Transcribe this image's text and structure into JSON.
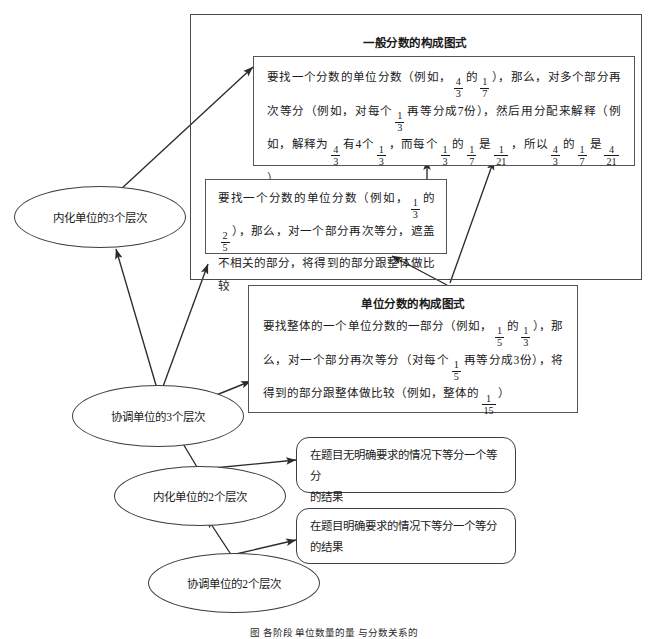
{
  "diagram": {
    "title_outer_panel": "一般分数的构成图式",
    "title_inner_panel": "单位分数的构成图式",
    "general_fraction_box": {
      "line1_a": "要找一个分数的单位分数（例如，",
      "f1": [
        "4",
        "3"
      ],
      "line1_b": "的",
      "f2": [
        "1",
        "7"
      ],
      "line1_c": "），那么，对多个部分再次等分",
      "line2_a": "（例如，对每个",
      "f3": [
        "1",
        "3"
      ],
      "line2_b": "再等分成7份），然后用分配来解释（例如，解释为",
      "f4": [
        "4",
        "3"
      ],
      "line2_c": "有",
      "line3_a": "4个",
      "f5": [
        "1",
        "3"
      ],
      "line3_b": "，而每个",
      "f6": [
        "1",
        "3"
      ],
      "line3_c": "的",
      "f7": [
        "1",
        "7"
      ],
      "line3_d": "是",
      "f8": [
        "1",
        "21"
      ],
      "line3_e": "，所以",
      "f9": [
        "4",
        "3"
      ],
      "line3_f": "的",
      "f10": [
        "1",
        "7"
      ],
      "line3_g": "是",
      "f11": [
        "4",
        "21"
      ],
      "line3_h": "）"
    },
    "unit_fraction_small_box": {
      "line1_a": "要找一个分数的单位分数（例如，",
      "f1": [
        "1",
        "3"
      ],
      "line1_b": "的",
      "f2": [
        "2",
        "5"
      ],
      "line1_c": "），那么，对",
      "line2": "一个部分再次等分，遮盖不相关的部分，将得到的部",
      "line3": "分跟整体做比较"
    },
    "unit_fraction_box": {
      "line1_a": "要找整体的一个单位分数的一部分（例如，",
      "f1": [
        "1",
        "5"
      ],
      "line1_b": "的",
      "f2": [
        "1",
        "3"
      ],
      "line1_c": "），那么，",
      "line2_a": "对一个部分再次等分（对每个",
      "f3": [
        "1",
        "5"
      ],
      "line2_b": "再等分成3份），将得到的部",
      "line3_a": "分跟整体做比较（例如，整体的",
      "f4": [
        "1",
        "15"
      ],
      "line3_b": "）"
    },
    "ellipses": [
      {
        "id": "internalize-3",
        "label": "内化单位的3个层次"
      },
      {
        "id": "coordinate-3",
        "label": "协调单位的3个层次"
      },
      {
        "id": "internalize-2",
        "label": "内化单位的2个层次"
      },
      {
        "id": "coordinate-2",
        "label": "协调单位的2个层次"
      }
    ],
    "result_boxes": [
      {
        "id": "implicit-result",
        "line1": "在题目无明确要求的情况下等分一个等分",
        "line2": "的结果"
      },
      {
        "id": "explicit-result",
        "line1": "在题目明确要求的情况下等分一个等分",
        "line2": "的结果"
      }
    ],
    "caption": "图    各阶段  单位数量的量  与分数关系的",
    "colors": {
      "stroke": "#3d3d3d",
      "frame": "#4a4a4a",
      "text": "#1a1a1a",
      "background": "#ffffff"
    }
  }
}
